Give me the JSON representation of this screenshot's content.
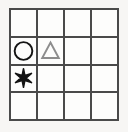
{
  "figure": {
    "kind": "shape-grid-puzzle",
    "background_color": "#f7f6f4",
    "cell_background_color": "#fdfdfc",
    "grid": {
      "rows": 4,
      "columns": 4,
      "line_color": "#4a4a4a",
      "line_width_px": 2
    },
    "shape_styles": {
      "circle": {
        "stroke": "#141414",
        "fill": "none",
        "stroke_width": 2
      },
      "triangle": {
        "stroke": "#8d8d8d",
        "fill": "none",
        "stroke_width": 2
      },
      "asterisk": {
        "stroke": "none",
        "fill": "#141414",
        "points": 6
      }
    },
    "cells": [
      {
        "row": 1,
        "col": 1,
        "shape": "",
        "label": "empty cell row 1 column 1"
      },
      {
        "row": 1,
        "col": 2,
        "shape": "",
        "label": "empty cell row 1 column 2"
      },
      {
        "row": 1,
        "col": 3,
        "shape": "",
        "label": "empty cell row 1 column 3"
      },
      {
        "row": 1,
        "col": 4,
        "shape": "",
        "label": "empty cell row 1 column 4"
      },
      {
        "row": 2,
        "col": 1,
        "shape": "circle",
        "label": "circle outline"
      },
      {
        "row": 2,
        "col": 2,
        "shape": "triangle",
        "label": "triangle outline"
      },
      {
        "row": 2,
        "col": 3,
        "shape": "",
        "label": "empty cell row 2 column 3"
      },
      {
        "row": 2,
        "col": 4,
        "shape": "",
        "label": "empty cell row 2 column 4"
      },
      {
        "row": 3,
        "col": 1,
        "shape": "asterisk",
        "label": "filled asterisk star"
      },
      {
        "row": 3,
        "col": 2,
        "shape": "",
        "label": "empty cell row 3 column 2"
      },
      {
        "row": 3,
        "col": 3,
        "shape": "",
        "label": "empty cell row 3 column 3"
      },
      {
        "row": 3,
        "col": 4,
        "shape": "",
        "label": "empty cell row 3 column 4"
      },
      {
        "row": 4,
        "col": 1,
        "shape": "",
        "label": "empty cell row 4 column 1"
      },
      {
        "row": 4,
        "col": 2,
        "shape": "",
        "label": "empty cell row 4 column 2"
      },
      {
        "row": 4,
        "col": 3,
        "shape": "",
        "label": "empty cell row 4 column 3"
      },
      {
        "row": 4,
        "col": 4,
        "shape": "",
        "label": "empty cell row 4 column 4"
      }
    ]
  }
}
